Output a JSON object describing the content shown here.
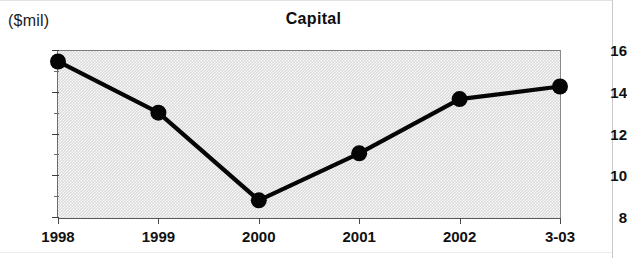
{
  "chart_data": {
    "type": "line",
    "title": "Capital",
    "xlabel": "",
    "ylabel": "($mil)",
    "unit_label": "($mil)",
    "categories": [
      "1998",
      "1999",
      "2000",
      "2001",
      "2002",
      "3-03"
    ],
    "values": [
      15.45,
      13.0,
      8.8,
      11.05,
      13.65,
      14.25
    ],
    "series": [
      {
        "name": "Capital",
        "values": [
          15.45,
          13.0,
          8.8,
          11.05,
          13.65,
          14.25
        ]
      }
    ],
    "ylim": [
      8,
      16
    ],
    "y_ticks": [
      8,
      10,
      12,
      14,
      16
    ],
    "y_tick_labels": [
      "8",
      "10",
      "12",
      "14",
      "16"
    ],
    "y_minor_ticks": [
      9,
      11,
      13,
      15
    ],
    "grid": false,
    "legend": null,
    "marker": "filled-circle",
    "line_color": "#050505",
    "plot_background": "#dcdcdc"
  },
  "chart": {
    "title": "Capital",
    "unit_label": "($mil)"
  }
}
